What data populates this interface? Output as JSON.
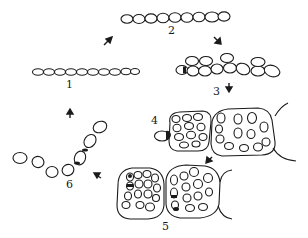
{
  "diagram": {
    "type": "life-cycle",
    "stage_labels": [
      "1",
      "2",
      "3",
      "4",
      "5",
      "6"
    ],
    "stages": [
      {
        "id": "1",
        "label": "1",
        "description": "short filament (hormogonium) of small cells"
      },
      {
        "id": "2",
        "label": "2",
        "description": "elongated filament of enlarged cells"
      },
      {
        "id": "3",
        "label": "3",
        "description": "cells dividing, filament becoming multiseriate; heterocyst at end"
      },
      {
        "id": "4",
        "label": "4",
        "description": "young colonies enclosed in gelatinous sheath with terminal heterocyst"
      },
      {
        "id": "5",
        "label": "5",
        "description": "mature colonies with intercalary heterocysts"
      },
      {
        "id": "6",
        "label": "6",
        "description": "released hormogonium filament with heterocysts"
      }
    ],
    "arrows": [
      {
        "from": "1",
        "to": "2",
        "direction": "up-right"
      },
      {
        "from": "2",
        "to": "3",
        "direction": "down-right"
      },
      {
        "from": "3",
        "to": "4",
        "direction": "down"
      },
      {
        "from": "4",
        "to": "5",
        "direction": "down-left"
      },
      {
        "from": "5",
        "to": "6",
        "direction": "up-left"
      },
      {
        "from": "6",
        "to": "1",
        "direction": "up"
      }
    ],
    "colors": {
      "line": "#1a1a1a",
      "background": "#ffffff"
    }
  }
}
